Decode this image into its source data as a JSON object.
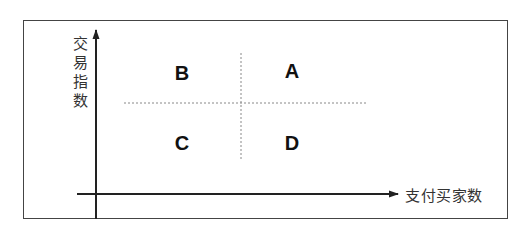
{
  "diagram": {
    "type": "quadrant",
    "y_axis_label": "交易指数",
    "x_axis_label": "支付买家数",
    "quadrants": {
      "top_left": "B",
      "top_right": "A",
      "bottom_left": "C",
      "bottom_right": "D"
    },
    "colors": {
      "axis": "#222222",
      "frame": "#444444",
      "divider": "#888888",
      "text": "#111111"
    }
  }
}
